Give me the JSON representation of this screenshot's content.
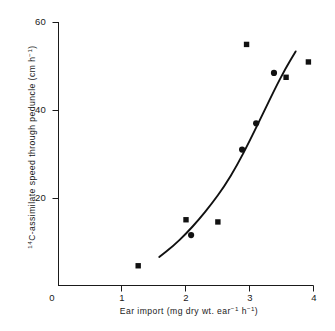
{
  "chart_data": {
    "type": "scatter",
    "title": "",
    "xlabel": "Ear import (mg dry wt. ear⁻¹ h⁻¹)",
    "ylabel": "¹⁴C-assimilate speed through peduncle (cm h⁻¹)",
    "xlim": [
      0,
      4.15
    ],
    "ylim": [
      0,
      60
    ],
    "xticks": [
      0,
      1,
      2,
      3,
      4
    ],
    "xtick_labels": [
      "0",
      "1",
      "2",
      "3",
      "4"
    ],
    "yticks": [
      0,
      20,
      40,
      60
    ],
    "ytick_labels": [
      "0",
      "20",
      "40",
      "60"
    ],
    "ytick_labels_shown": [
      "20",
      "40",
      "60"
    ],
    "grid": false,
    "legend": "none",
    "points": [
      {
        "x": 1.25,
        "y": 4.5,
        "marker": "square"
      },
      {
        "x": 2.0,
        "y": 15.0,
        "marker": "square"
      },
      {
        "x": 2.08,
        "y": 11.5,
        "marker": "circle"
      },
      {
        "x": 2.5,
        "y": 14.5,
        "marker": "square"
      },
      {
        "x": 2.88,
        "y": 31.0,
        "marker": "circle"
      },
      {
        "x": 2.95,
        "y": 55.0,
        "marker": "square"
      },
      {
        "x": 3.1,
        "y": 37.0,
        "marker": "circle"
      },
      {
        "x": 3.38,
        "y": 48.5,
        "marker": "circle"
      },
      {
        "x": 3.57,
        "y": 47.5,
        "marker": "square"
      },
      {
        "x": 3.92,
        "y": 51.0,
        "marker": "square"
      }
    ],
    "fit_curve": {
      "description": "fitted exponential trend line",
      "x_start": 1.58,
      "x_end": 3.72,
      "points": [
        {
          "x": 1.58,
          "y": 6.5
        },
        {
          "x": 1.8,
          "y": 9.0
        },
        {
          "x": 2.0,
          "y": 11.8
        },
        {
          "x": 2.2,
          "y": 15.0
        },
        {
          "x": 2.4,
          "y": 18.6
        },
        {
          "x": 2.6,
          "y": 22.6
        },
        {
          "x": 2.8,
          "y": 27.4
        },
        {
          "x": 3.0,
          "y": 33.0
        },
        {
          "x": 3.2,
          "y": 39.0
        },
        {
          "x": 3.4,
          "y": 45.0
        },
        {
          "x": 3.56,
          "y": 49.5
        },
        {
          "x": 3.72,
          "y": 53.4
        }
      ]
    },
    "axis_color": "#1a1a1a",
    "marker_color": "#111111",
    "curve_color": "#111111"
  },
  "labels": {
    "x_title_main": "Ear import (mg dry wt. ear",
    "x_title_sup1": "−1",
    "x_title_mid": " h",
    "x_title_sup2": "−1",
    "x_title_end": ")",
    "y_title_sup0": "14",
    "y_title_main": "C-assimilate speed through peduncle (cm h",
    "y_title_sup1": "−1",
    "y_title_end": ")"
  }
}
